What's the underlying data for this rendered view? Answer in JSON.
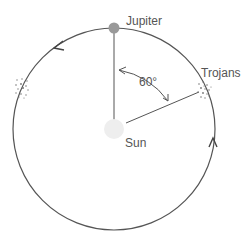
{
  "labels": {
    "planet": "Jupiter",
    "star": "Sun",
    "asteroids": "Trojans",
    "angle": "60°"
  },
  "colors": {
    "orbit": "#555555",
    "planet": "#999999",
    "star": "#eeeeee",
    "text": "#555555",
    "dots": "#777777"
  },
  "geometry": {
    "orbit_center": [
      114,
      129
    ],
    "orbit_radius": 101,
    "angle_between_jupiter_and_trojans_deg": 60
  }
}
